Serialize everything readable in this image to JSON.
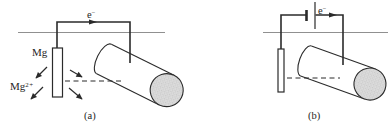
{
  "figure": {
    "panels": [
      {
        "id": "a",
        "caption": "(a)",
        "labels": {
          "electron_flow": {
            "base": "e",
            "sup": "−"
          },
          "anode_material": "Mg",
          "ion": {
            "base": "Mg",
            "sup": "2+"
          }
        }
      },
      {
        "id": "b",
        "caption": "(b)",
        "labels": {
          "electron_flow": {
            "base": "e",
            "sup": "−"
          }
        }
      }
    ],
    "colors": {
      "line": "#2b2b2b",
      "ground": "#909090",
      "pipe_face_fill": "#dcdcdc",
      "stipple_dot": "#9a9a9a",
      "electrode_fill": "#ffffff",
      "background": "#ffffff"
    }
  }
}
